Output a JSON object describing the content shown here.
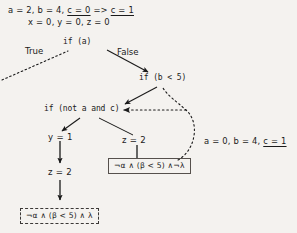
{
  "diagram": {
    "type": "control-flow-graph",
    "background_color": "#f4f2ef",
    "ink_color": "#1a1a1a",
    "top_state": {
      "line1_prefix": "a = 2, b = 4, ",
      "line1_underlined_a": "c = 0",
      "line1_arrow": " => ",
      "line1_underlined_b": "c = 1",
      "line2": "x = 0, y = 0, z = 0"
    },
    "nodes": {
      "if_a": "if (a)",
      "if_b_lt_5": "if (b < 5)",
      "if_not_a_and_c": "if (not a and c)",
      "assign_y1": "y = 1",
      "assign_z2_left": "z = 2",
      "assign_z2_middle": "z = 2"
    },
    "edge_labels": {
      "true": "True",
      "false": "False"
    },
    "side_state": {
      "prefix": "a = 0, b = 4, ",
      "underlined": "c = 1"
    },
    "formulas": {
      "solid_box": "¬α ∧ (β < 5) ∧¬λ",
      "dashed_box": "¬α ∧ (β < 5) ∧ λ"
    }
  }
}
